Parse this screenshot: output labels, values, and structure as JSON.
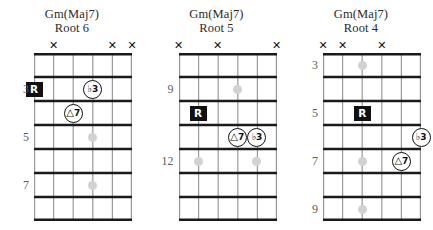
{
  "page": {
    "chord_name": "Gm(Maj7)",
    "background_color": "#ffffff",
    "ink_color": "#111111",
    "inlay_color": "#d2d2d2",
    "fretnum_color": "#5c5c5c"
  },
  "legend": {
    "root_label": "R",
    "mute_symbol": "✕",
    "third_label": "3",
    "third_accidental": "♭",
    "seventh_label": "7",
    "seventh_accidental": "△"
  },
  "diagrams": [
    {
      "id": "root6",
      "title_line1": "Gm(Maj7)",
      "title_line2": "Root 6",
      "strings": 6,
      "frets": 7,
      "start_fret": 2,
      "fret_numbers": [
        {
          "label": "3",
          "fret_index": 1
        },
        {
          "label": "5",
          "fret_index": 3
        },
        {
          "label": "7",
          "fret_index": 5
        }
      ],
      "mutes": [
        2,
        5,
        6
      ],
      "inlays": [
        {
          "string": 4,
          "fret_index": 1
        },
        {
          "string": 4,
          "fret_index": 3
        },
        {
          "string": 4,
          "fret_index": 5
        }
      ],
      "markers": [
        {
          "type": "root",
          "label": "R",
          "accidental": "",
          "string": 1,
          "fret_index": 1
        },
        {
          "type": "circle",
          "label": "3",
          "accidental": "♭",
          "string": 4,
          "fret_index": 1
        },
        {
          "type": "circle",
          "label": "7",
          "accidental": "△",
          "string": 3,
          "fret_index": 2
        }
      ]
    },
    {
      "id": "root5",
      "title_line1": "Gm(Maj7)",
      "title_line2": "Root 5",
      "strings": 6,
      "frets": 7,
      "start_fret": 8,
      "fret_numbers": [
        {
          "label": "9",
          "fret_index": 1
        },
        {
          "label": "12",
          "fret_index": 4
        }
      ],
      "mutes": [
        1,
        3,
        6
      ],
      "inlays": [
        {
          "string": 4,
          "fret_index": 1
        },
        {
          "string": 2,
          "fret_index": 4
        },
        {
          "string": 5,
          "fret_index": 4
        }
      ],
      "markers": [
        {
          "type": "root",
          "label": "R",
          "accidental": "",
          "string": 2,
          "fret_index": 2
        },
        {
          "type": "circle",
          "label": "7",
          "accidental": "△",
          "string": 4,
          "fret_index": 3
        },
        {
          "type": "circle",
          "label": "3",
          "accidental": "♭",
          "string": 5,
          "fret_index": 3
        }
      ]
    },
    {
      "id": "root4",
      "title_line1": "Gm(Maj7)",
      "title_line2": "Root 4",
      "strings": 6,
      "frets": 7,
      "start_fret": 2,
      "fret_numbers": [
        {
          "label": "3",
          "fret_index": 0
        },
        {
          "label": "5",
          "fret_index": 2
        },
        {
          "label": "7",
          "fret_index": 4
        },
        {
          "label": "9",
          "fret_index": 6
        }
      ],
      "mutes": [
        1,
        2,
        4
      ],
      "inlays": [
        {
          "string": 3,
          "fret_index": 0
        },
        {
          "string": 3,
          "fret_index": 2
        },
        {
          "string": 3,
          "fret_index": 4
        },
        {
          "string": 3,
          "fret_index": 6
        }
      ],
      "markers": [
        {
          "type": "root",
          "label": "R",
          "accidental": "",
          "string": 3,
          "fret_index": 2
        },
        {
          "type": "circle",
          "label": "3",
          "accidental": "♭",
          "string": 6,
          "fret_index": 3
        },
        {
          "type": "circle",
          "label": "7",
          "accidental": "△",
          "string": 5,
          "fret_index": 4
        }
      ]
    }
  ]
}
